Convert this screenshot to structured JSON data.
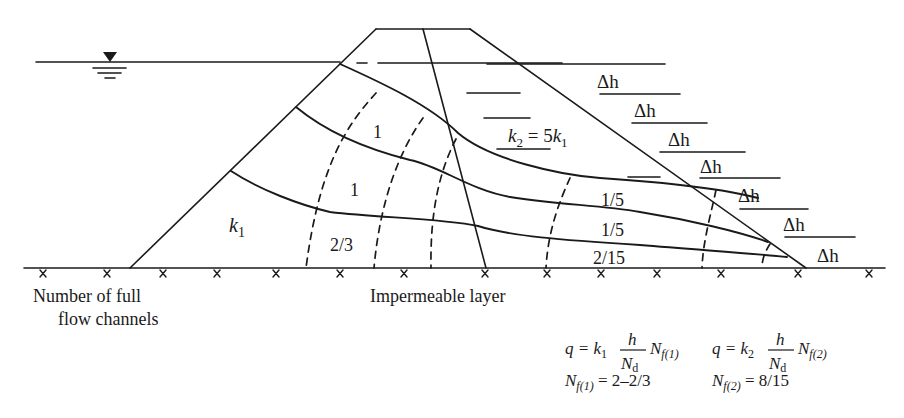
{
  "figure": {
    "type": "flow-net-two-zone-earth-dam",
    "labels": {
      "zone1_permeability": "k",
      "zone1_permeability_sub": "1",
      "zone2_relation_k": "k",
      "zone2_relation_sub": "2",
      "zone2_relation_eq": " = 5",
      "zone2_relation_k1": "k",
      "zone2_relation_k1_sub": "1",
      "flow_channel_values_zone1": [
        "1",
        "1",
        "2/3"
      ],
      "flow_channel_values_zone2": [
        "1/5",
        "1/5",
        "2/15"
      ],
      "head_drop_label": "Δh",
      "head_drop_count": 7,
      "left_caption_line1": "Number of full",
      "left_caption_line2": "flow channels",
      "base_caption": "Impermeable layer"
    },
    "equations": {
      "q1_prefix": "q = k",
      "q1_k_sub": "1",
      "q1_num": "h",
      "q1_den": "N",
      "q1_den_sub": "d",
      "q1_suffix": "N",
      "q1_suffix_sub": "f(1)",
      "q2_prefix": "q = k",
      "q2_k_sub": "2",
      "q2_num": "h",
      "q2_den": "N",
      "q2_den_sub": "d",
      "q2_suffix": "N",
      "q2_suffix_sub": "f(2)",
      "nf1_lhs": "N",
      "nf1_sub": "f(1)",
      "nf1_rhs": " = 2–2/3",
      "nf2_lhs": "N",
      "nf2_sub": "f(2)",
      "nf2_rhs": " = 8/15"
    },
    "colors": {
      "line": "#1a1a1a",
      "background": "#ffffff"
    }
  }
}
